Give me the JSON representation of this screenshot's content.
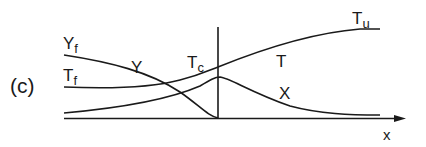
{
  "figure": {
    "panel_label": "(c)",
    "axis_label_x": "x",
    "labels": {
      "Yf": {
        "main": "Y",
        "sub": "f"
      },
      "Tf": {
        "main": "T",
        "sub": "f"
      },
      "Tc": {
        "main": "T",
        "sub": "c"
      },
      "Tu": {
        "main": "T",
        "sub": "u"
      },
      "Y": "Y",
      "T": "T",
      "X": "X"
    },
    "colors": {
      "line": "#1a1a1a",
      "background": "#ffffff"
    }
  }
}
